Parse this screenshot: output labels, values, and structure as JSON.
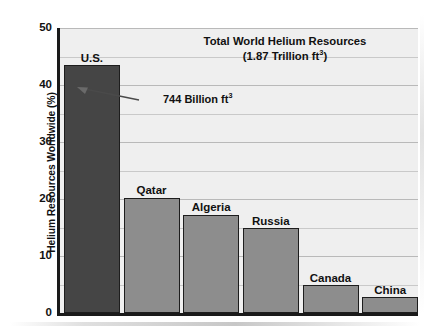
{
  "chart_data": {
    "type": "bar",
    "title": "Total World Helium Resources",
    "subtitle": "(1.87 Trillion ft³)",
    "xlabel": "",
    "ylabel": "Helium Resources Worldwide (%)",
    "ylim": [
      0,
      50
    ],
    "ytick_labels": [
      "0",
      "10",
      "20",
      "30",
      "40",
      "50"
    ],
    "ytick_values": [
      0,
      10,
      20,
      30,
      40,
      50
    ],
    "grid": true,
    "grid_minor_step": 5,
    "legend": "none",
    "categories": [
      "U.S.",
      "Qatar",
      "Algeria",
      "Russia",
      "Canada",
      "China"
    ],
    "values": [
      43.5,
      20.2,
      17.2,
      14.9,
      4.9,
      2.8
    ],
    "bar_colors": [
      "#454545",
      "#8d8d8d",
      "#8d8d8d",
      "#8d8d8d",
      "#8d8d8d",
      "#8d8d8d"
    ],
    "annotations": [
      {
        "text": "744 Billion ft³",
        "target_category": "U.S.",
        "style": "arrow-pointing-left"
      }
    ]
  },
  "colors": {
    "plot_background": "#efefef",
    "axis": "#1a1a1a",
    "gridline": "#c9c9c9",
    "bar_default": "#8d8d8d",
    "bar_highlight": "#454545",
    "text": "#111111",
    "page_background": "#ffffff"
  },
  "title": {
    "line1": "Total World Helium Resources",
    "line2_prefix": "(1.87 Trillion ft",
    "line2_sup": "3",
    "line2_suffix": ")"
  },
  "annotation": {
    "prefix": "744 Billion ft",
    "sup": "3",
    "suffix": ""
  },
  "y_axis": {
    "title_text": "Helium Resources Worldwide (%)",
    "ticks": [
      {
        "label": "50"
      },
      {
        "label": "40"
      },
      {
        "label": "30"
      },
      {
        "label": "20"
      },
      {
        "label": "10"
      },
      {
        "label": "0"
      }
    ]
  },
  "bars": [
    {
      "label": "U.S.",
      "value": 43.5
    },
    {
      "label": "Qatar",
      "value": 20.2
    },
    {
      "label": "Algeria",
      "value": 17.2
    },
    {
      "label": "Russia",
      "value": 14.9
    },
    {
      "label": "Canada",
      "value": 4.9
    },
    {
      "label": "China",
      "value": 2.8
    }
  ]
}
